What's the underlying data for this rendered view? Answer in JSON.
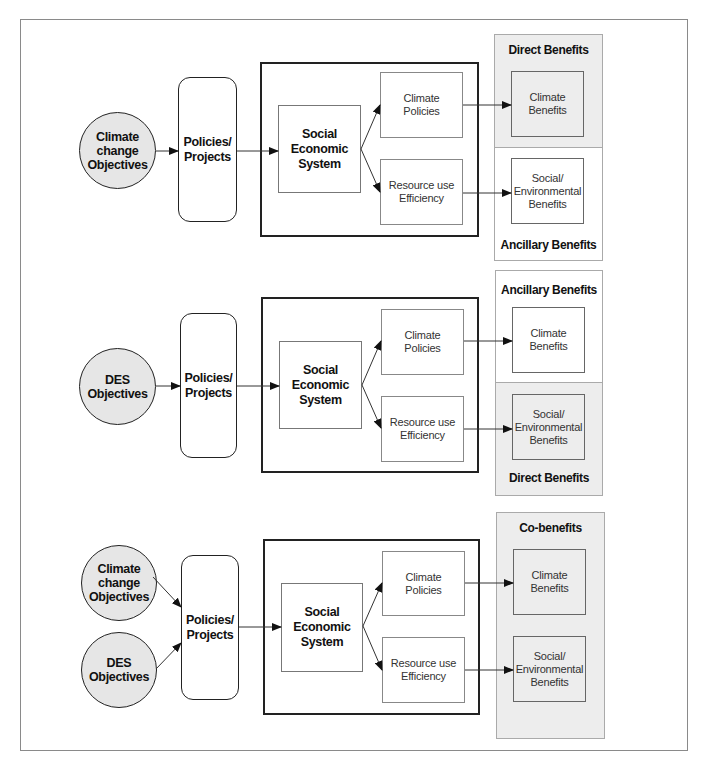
{
  "diagram": {
    "sections": [
      {
        "objectives": [
          "Climate\nchange\nObjectives"
        ],
        "policies": "Policies/\nProjects",
        "system": "Social\nEconomic\nSystem",
        "outputs": [
          "Climate\nPolicies",
          "Resource use\nEfficiency"
        ],
        "benefits": [
          "Climate\nBenefits",
          "Social/\nEnvironmental\nBenefits"
        ],
        "panel_titles": {
          "top": "Direct Benefits",
          "bottom": "Ancillary Benefits"
        },
        "shaded": "top"
      },
      {
        "objectives": [
          "DES\nObjectives"
        ],
        "policies": "Policies/\nProjects",
        "system": "Social\nEconomic\nSystem",
        "outputs": [
          "Climate\nPolicies",
          "Resource use\nEfficiency"
        ],
        "benefits": [
          "Climate\nBenefits",
          "Social/\nEnvironmental\nBenefits"
        ],
        "panel_titles": {
          "top": "Ancillary Benefits",
          "bottom": "Direct Benefits"
        },
        "shaded": "bottom"
      },
      {
        "objectives": [
          "Climate\nchange\nObjectives",
          "DES\nObjectives"
        ],
        "policies": "Policies/\nProjects",
        "system": "Social\nEconomic\nSystem",
        "outputs": [
          "Climate\nPolicies",
          "Resource use\nEfficiency"
        ],
        "benefits": [
          "Climate\nBenefits",
          "Social/\nEnvironmental\nBenefits"
        ],
        "panel_titles": {
          "top": "Co-benefits"
        },
        "shaded": "all"
      }
    ],
    "colors": {
      "objective_fill": "#e6e6e6",
      "benefit_shade": "#ededed",
      "line": "#222222"
    }
  }
}
